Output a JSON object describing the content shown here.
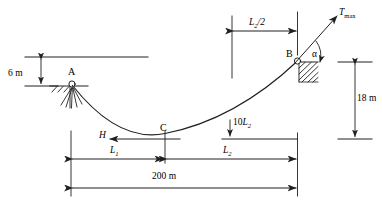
{
  "figure": {
    "stroke_color": "#231f20",
    "background": "#ffffff"
  },
  "points": {
    "a_label": "A",
    "b_label": "B",
    "c_label": "C"
  },
  "forces": {
    "tension_symbol": "T",
    "tension_subscript": "max",
    "horizontal_symbol": "H",
    "angle_symbol": "α",
    "load_prefix": "10",
    "load_symbol": "L",
    "load_subscript": "2"
  },
  "dimensions": {
    "height_left": "6 m",
    "height_right": "18 m",
    "span_total": "200 m",
    "seg_left_symbol": "L",
    "seg_left_subscript": "1",
    "seg_right_symbol": "L",
    "seg_right_subscript": "2",
    "half_right_symbol": "L",
    "half_right_subscript": "2",
    "half_right_suffix": "/2"
  }
}
